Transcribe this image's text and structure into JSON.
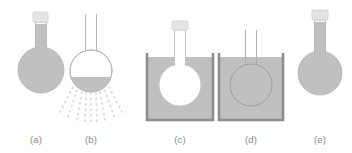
{
  "figure": {
    "title": "",
    "background_color": "#ffffff",
    "width": 352,
    "height": 153
  },
  "colors": {
    "liquid_gray": "#c0c0c0",
    "liquid_gray_dark": "#b6b6b6",
    "glass_outline": "#b9b9b9",
    "beaker_wall": "#8d8d8d",
    "stopper_fill": "#e4e4e4",
    "stopper_outline": "#cfcfcf",
    "empty_flask_fill": "#ffffff",
    "ray_dot": "#d8d8d8",
    "label_text": "#8a8a8a",
    "flask_outline_in_liquid": "#9a9a9a"
  },
  "panels": [
    {
      "id": "a",
      "label": "(a)",
      "label_x": 36,
      "label_y": 143,
      "description": "stoppered-flask-full-of-liquid",
      "flask": {
        "stopper": true,
        "neck_open": false,
        "fill_state": "full",
        "fill_color": "#c0c0c0"
      },
      "beaker": null,
      "rays": null
    },
    {
      "id": "b",
      "label": "(b)",
      "label_x": 91,
      "label_y": 143,
      "description": "open-flask-partially-filled-with-radiating-rays",
      "flask": {
        "stopper": false,
        "neck_open": true,
        "fill_state": "partial",
        "fill_color": "#c0c0c0"
      },
      "beaker": null,
      "rays": {
        "count": 9,
        "dots_per_ray": 5,
        "color": "#d8d8d8",
        "direction": "downward-fan"
      }
    },
    {
      "id": "c",
      "label": "(c)",
      "label_x": 180,
      "label_y": 143,
      "description": "empty-stoppered-flask-submerged-in-beaker-of-liquid",
      "flask": {
        "stopper": true,
        "neck_open": false,
        "fill_state": "empty",
        "fill_color": "#ffffff"
      },
      "beaker": {
        "present": true,
        "liquid_color": "#c0c0c0",
        "wall_color": "#8d8d8d",
        "fill_level": "high"
      },
      "rays": null
    },
    {
      "id": "d",
      "label": "(d)",
      "label_x": 251,
      "label_y": 143,
      "description": "open-flask-filled-with-liquid-submerged-in-beaker-of-liquid",
      "flask": {
        "stopper": false,
        "neck_open": true,
        "fill_state": "full",
        "fill_color": "#c0c0c0"
      },
      "beaker": {
        "present": true,
        "liquid_color": "#c0c0c0",
        "wall_color": "#8d8d8d",
        "fill_level": "high"
      },
      "rays": null
    },
    {
      "id": "e",
      "label": "(e)",
      "label_x": 320,
      "label_y": 143,
      "description": "stoppered-flask-full-of-liquid",
      "flask": {
        "stopper": true,
        "neck_open": false,
        "fill_state": "full",
        "fill_color": "#c0c0c0"
      },
      "beaker": null,
      "rays": null
    }
  ]
}
